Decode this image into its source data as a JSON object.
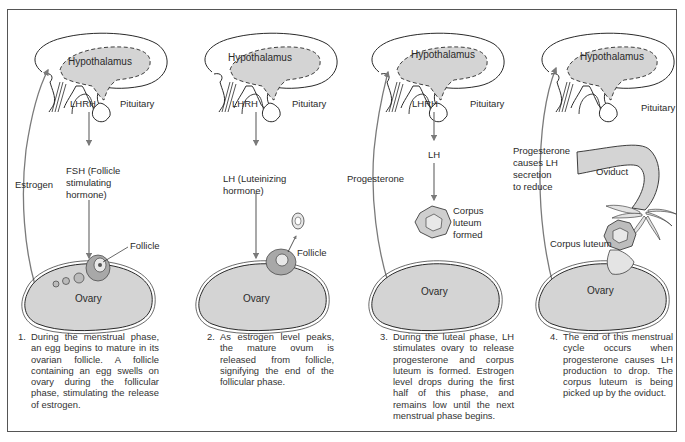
{
  "diagram": {
    "colors": {
      "fill": "#d4d4d4",
      "stroke": "#2a2a2a",
      "arrow": "#7a7a7a",
      "border": "#555555"
    },
    "panels": [
      {
        "hypothalamus": "Hypothalamus",
        "lhrh": "LHRH",
        "pituitary": "Pituitary",
        "feedback": "Estrogen",
        "hormone_line1": "FSH (Follicle",
        "hormone_line2": "stimulating",
        "hormone_line3": "hormone)",
        "structure": "Follicle",
        "ovary": "Ovary",
        "caption_num": "1.",
        "caption": "During the menstrual phase, an egg begins to mature in its ovarian follicle. A follicle containing an egg swells on ovary during the follicular phase, stimulating the release of estrogen."
      },
      {
        "hypothalamus": "Hypothalamus",
        "lhrh": "LHRH",
        "pituitary": "Pituitary",
        "hormone_line1": "LH (Luteinizing",
        "hormone_line2": "hormone)",
        "structure": "Follicle",
        "ovary": "Ovary",
        "caption_num": "2.",
        "caption": "As estrogen level peaks, the mature ovum is released from follicle, signifying the end of the follicular phase."
      },
      {
        "hypothalamus": "Hypothalamus",
        "lhrh": "LHRH",
        "pituitary": "Pituitary",
        "feedback": "Progesterone",
        "hormone_line1": "LH",
        "structure_line1": "Corpus",
        "structure_line2": "luteum",
        "structure_line3": "formed",
        "ovary": "Ovary",
        "caption_num": "3.",
        "caption": "During the luteal phase, LH stimulates ovary to release progesterone and corpus luteum is formed. Estrogen level drops during the first half of this phase, and remains low until the next menstrual phase begins."
      },
      {
        "hypothalamus": "Hypothalamus",
        "pituitary": "Pituitary",
        "feedback_line1": "Progesterone",
        "feedback_line2": "causes LH",
        "feedback_line3": "secretion",
        "feedback_line4": "to reduce",
        "oviduct": "Oviduct",
        "structure": "Corpus luteum",
        "ovary": "Ovary",
        "caption_num": "4.",
        "caption": "The end of this menstrual cycle occurs when progesterone causes LH production to drop. The corpus luteum is being picked up by the oviduct."
      }
    ]
  }
}
